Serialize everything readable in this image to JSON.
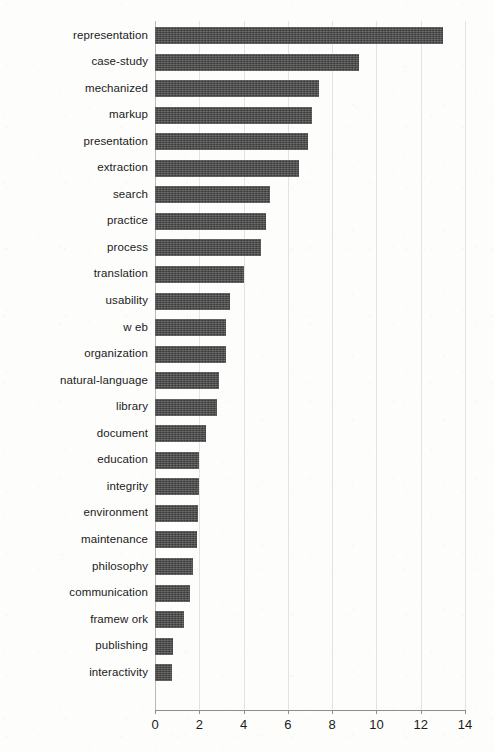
{
  "chart_data": {
    "type": "bar",
    "orientation": "horizontal",
    "title": "",
    "xlabel": "",
    "ylabel": "",
    "xlim": [
      0,
      14
    ],
    "ylim": null,
    "xticks": [
      0,
      2,
      4,
      6,
      8,
      10,
      12,
      14
    ],
    "grid": "vertical",
    "legend": null,
    "bar_color": "#484848",
    "categories": [
      "representation",
      "case-study",
      "mechanized",
      "markup",
      "presentation",
      "extraction",
      "search",
      "practice",
      "process",
      "translation",
      "usability",
      "w eb",
      "organization",
      "natural-language",
      "library",
      "document",
      "education",
      "integrity",
      "environment",
      "maintenance",
      "philosophy",
      "communication",
      "framew ork",
      "publishing",
      "interactivity"
    ],
    "values": [
      13.0,
      9.2,
      7.4,
      7.1,
      6.9,
      6.5,
      5.2,
      5.0,
      4.8,
      4.0,
      3.4,
      3.2,
      3.2,
      2.9,
      2.8,
      2.3,
      2.0,
      2.0,
      1.95,
      1.9,
      1.7,
      1.6,
      1.3,
      0.8,
      0.75
    ]
  }
}
